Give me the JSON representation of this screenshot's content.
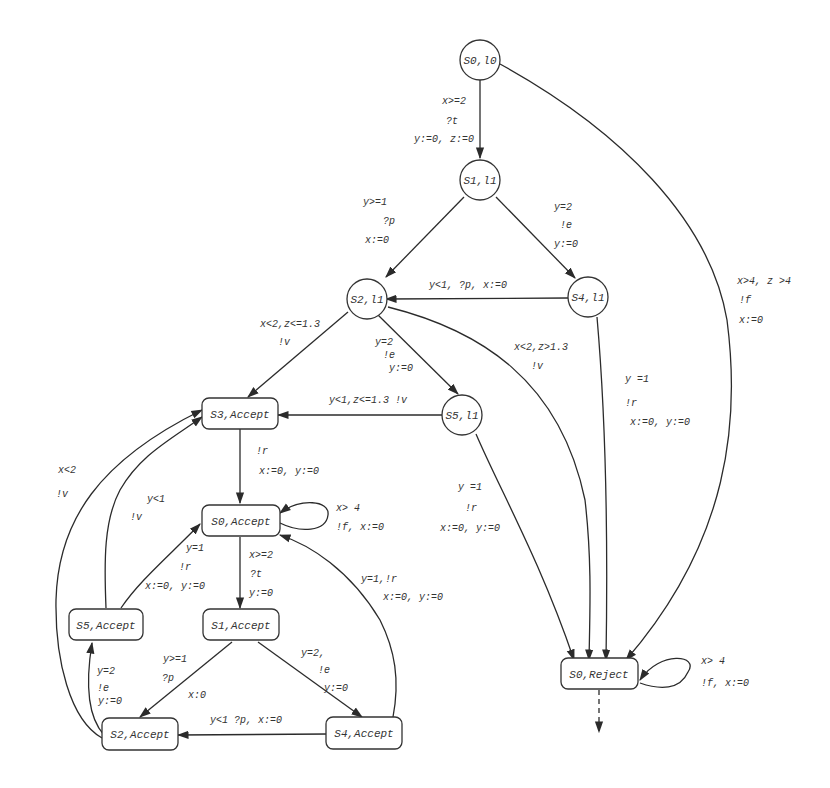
{
  "diagram": {
    "type": "timed-automaton-product",
    "nodes": {
      "s0_l0": {
        "label": "S0,l0",
        "shape": "circle"
      },
      "s1_l1": {
        "label": "S1,l1",
        "shape": "circle"
      },
      "s2_l1": {
        "label": "S2,l1",
        "shape": "circle"
      },
      "s4_l1": {
        "label": "S4,l1",
        "shape": "circle"
      },
      "s5_l1": {
        "label": "S5,l1",
        "shape": "circle"
      },
      "s3_accept": {
        "label": "S3,Accept",
        "shape": "rounded-rect"
      },
      "s0_accept": {
        "label": "S0,Accept",
        "shape": "rounded-rect"
      },
      "s1_accept": {
        "label": "S1,Accept",
        "shape": "rounded-rect"
      },
      "s5_accept": {
        "label": "S5,Accept",
        "shape": "rounded-rect"
      },
      "s2_accept": {
        "label": "S2,Accept",
        "shape": "rounded-rect"
      },
      "s4_accept": {
        "label": "S4,Accept",
        "shape": "rounded-rect"
      },
      "s0_reject": {
        "label": "S0,Reject",
        "shape": "rounded-rect"
      }
    },
    "edges": {
      "e_s0l0_s1l1": {
        "from": "S0,l0",
        "to": "S1,l1",
        "guard": "x>=2",
        "action": "?t",
        "reset": "y:=0, z:=0"
      },
      "e_s1l1_s2l1": {
        "from": "S1,l1",
        "to": "S2,l1",
        "guard": "y>=1",
        "action": "?p",
        "reset": "x:=0"
      },
      "e_s1l1_s4l1": {
        "from": "S1,l1",
        "to": "S4,l1",
        "guard": "y=2",
        "action": "!e",
        "reset": "y:=0"
      },
      "e_s4l1_s2l1": {
        "from": "S4,l1",
        "to": "S2,l1",
        "text": "y<1, ?p, x:=0"
      },
      "e_s2l1_s3acc": {
        "from": "S2,l1",
        "to": "S3,Accept",
        "guard": "x<2,z<=1.3",
        "action": "!v"
      },
      "e_s2l1_s5l1": {
        "from": "S2,l1",
        "to": "S5,l1",
        "guard": "y=2",
        "action": "!e",
        "reset": "y:=0"
      },
      "e_s2l1_reject": {
        "from": "S2,l1",
        "to": "S0,Reject",
        "guard": "x<2,z>1.3",
        "action": "!v"
      },
      "e_s5l1_s3acc": {
        "from": "S5,l1",
        "to": "S3,Accept",
        "text": "y<1,z<=1.3 !v"
      },
      "e_s5l1_reject": {
        "from": "S5,l1",
        "to": "S0,Reject",
        "guard": "y =1",
        "action": "!r",
        "reset": "x:=0, y:=0"
      },
      "e_s4l1_reject": {
        "from": "S4,l1",
        "to": "S0,Reject",
        "guard": "y =1",
        "action": "!r",
        "reset": "x:=0, y:=0"
      },
      "e_s0l0_reject": {
        "from": "S0,l0",
        "to": "S0,Reject",
        "guard": "x>4, z >4",
        "action": "!f",
        "reset": "x:=0"
      },
      "e_s3acc_s0acc": {
        "from": "S3,Accept",
        "to": "S0,Accept",
        "action": "!r",
        "reset": "x:=0, y:=0"
      },
      "e_s0acc_self": {
        "from": "S0,Accept",
        "to": "S0,Accept",
        "guard": "x> 4",
        "text2": "!f, x:=0"
      },
      "e_s0acc_s1acc": {
        "from": "S0,Accept",
        "to": "S1,Accept",
        "guard": "x>=2",
        "action": "?t",
        "reset": "y:=0"
      },
      "e_s5acc_s0acc": {
        "from": "S5,Accept",
        "to": "S0,Accept",
        "guard": "y=1",
        "action": "!r",
        "reset": "x:=0, y:=0"
      },
      "e_s5acc_s3acc": {
        "from": "S5,Accept",
        "to": "S3,Accept",
        "guard": "y<1",
        "action": "!v"
      },
      "e_s2acc_s3acc": {
        "from": "S2,Accept",
        "to": "S3,Accept",
        "guard": "x<2",
        "action": "!v"
      },
      "e_s4acc_s0acc": {
        "from": "S4,Accept",
        "to": "S0,Accept",
        "text1": "y=1,!r",
        "text2": "x:=0, y:=0"
      },
      "e_s1acc_s2acc": {
        "from": "S1,Accept",
        "to": "S2,Accept",
        "guard": "y>=1",
        "action": "?p",
        "reset": "x:0"
      },
      "e_s1acc_s4acc": {
        "from": "S1,Accept",
        "to": "S4,Accept",
        "guard": "y=2,",
        "action": "!e",
        "reset": "y:=0"
      },
      "e_s4acc_s2acc": {
        "from": "S4,Accept",
        "to": "S2,Accept",
        "text": "y<1 ?p, x:=0"
      },
      "e_s2acc_s5acc": {
        "from": "S2,Accept",
        "to": "S5,Accept",
        "guard": "y=2",
        "action": "!e",
        "reset": "y:=0"
      },
      "e_reject_self": {
        "from": "S0,Reject",
        "to": "S0,Reject",
        "guard": "x> 4",
        "text2": "!f, x:=0"
      },
      "e_reject_out": {
        "from": "S0,Reject",
        "to": "",
        "style": "dashed"
      }
    }
  }
}
